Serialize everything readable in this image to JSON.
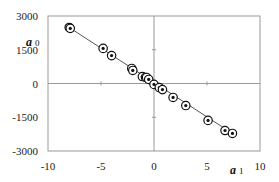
{
  "chart_data": {
    "type": "scatter",
    "title": "",
    "xlabel": "a1",
    "ylabel": "a0",
    "xlabel_main": "a",
    "xlabel_sub": "1",
    "ylabel_main": "a",
    "ylabel_sub": "0",
    "xlim": [
      -10,
      10
    ],
    "ylim": [
      -3000,
      3000
    ],
    "x_ticks": [
      -10,
      -5,
      0,
      5,
      10
    ],
    "y_ticks": [
      -3000,
      -1500,
      0,
      1500,
      3000
    ],
    "x_tick_labels": [
      "-10",
      "-5",
      "0",
      "5",
      "10"
    ],
    "y_tick_labels": [
      "-3000",
      "-1500",
      "0",
      "1500",
      "3000"
    ],
    "grid": false,
    "legend": null,
    "marker": "circle with dot",
    "series": [
      {
        "name": "points",
        "x": [
          -8.0,
          -7.9,
          -4.8,
          -4.0,
          -2.1,
          -2.0,
          -1.1,
          -0.8,
          -0.7,
          -0.5,
          0.0,
          0.5,
          0.8,
          1.8,
          3.0,
          5.1,
          6.7,
          7.4
        ],
        "y": [
          2490,
          2450,
          1560,
          1240,
          670,
          580,
          310,
          270,
          270,
          180,
          -40,
          -180,
          -270,
          -620,
          -980,
          -1640,
          -2090,
          -2220
        ]
      }
    ],
    "fit_line": {
      "x": [
        -8.0,
        7.4
      ],
      "y": [
        2490,
        -2220
      ]
    }
  },
  "colors": {
    "axis": "#999999",
    "frame": "#999999",
    "line": "#555555",
    "marker": "#111111"
  }
}
